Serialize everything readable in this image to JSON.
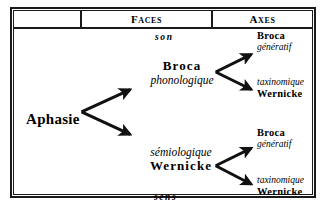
{
  "figure": {
    "header": {
      "col_empty": "",
      "col_faces": "Faces",
      "col_axes": "Axes"
    },
    "root": {
      "label": "Aphasie"
    },
    "faces": {
      "top_boundary_label": "son",
      "bottom_boundary_label": "sens",
      "branches": [
        {
          "main": "Broca",
          "sub": "phonologique"
        },
        {
          "sub": "sémiologique",
          "main": "Wernicke"
        }
      ]
    },
    "axes": [
      {
        "bold": "Broca",
        "italic": "génératif"
      },
      {
        "italic": "taxinomique",
        "bold": "Wernicke"
      },
      {
        "bold": "Broca",
        "italic": "génératif"
      },
      {
        "italic": "taxinomique",
        "bold": "Wernicke"
      }
    ],
    "colors": {
      "ink": "#1a1a1a",
      "paper": "#ffffff"
    }
  }
}
